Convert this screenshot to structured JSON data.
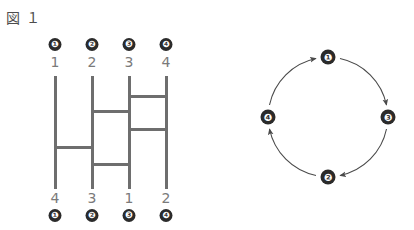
{
  "figures": [
    {
      "id": "fig1",
      "caption": "図 １",
      "type": "ladder-lottery",
      "top_badges": [
        "❶",
        "❷",
        "❸",
        "❹"
      ],
      "top_numbers": [
        "1",
        "2",
        "3",
        "4"
      ],
      "bottom_numbers": [
        "4",
        "3",
        "1",
        "2"
      ],
      "bottom_badges": [
        "❶",
        "❷",
        "❸",
        "❹"
      ],
      "rail_count": 4,
      "rungs": [
        {
          "from_rail": 3,
          "to_rail": 4,
          "y": 95
        },
        {
          "from_rail": 2,
          "to_rail": 3,
          "y": 110
        },
        {
          "from_rail": 3,
          "to_rail": 4,
          "y": 128
        },
        {
          "from_rail": 1,
          "to_rail": 2,
          "y": 146
        },
        {
          "from_rail": 2,
          "to_rail": 3,
          "y": 163
        }
      ],
      "line_color": "#6e6e6e",
      "badge_color": "#2b2b2b",
      "number_color": "#7a7a7a"
    },
    {
      "id": "fig2",
      "caption": "図 2",
      "type": "cycle",
      "nodes": [
        {
          "label": "❶",
          "position": "top"
        },
        {
          "label": "❸",
          "position": "right"
        },
        {
          "label": "❷",
          "position": "bottom"
        },
        {
          "label": "❹",
          "position": "left"
        }
      ],
      "arrows": [
        {
          "from": "❶",
          "to": "❸"
        },
        {
          "from": "❸",
          "to": "❷"
        },
        {
          "from": "❷",
          "to": "❹"
        },
        {
          "from": "❹",
          "to": "❶"
        }
      ],
      "direction": "clockwise",
      "arc_color": "#4a4a4a",
      "badge_color": "#2b2b2b"
    }
  ]
}
